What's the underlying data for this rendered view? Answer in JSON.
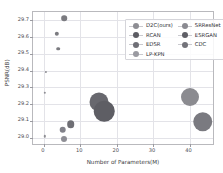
{
  "chart_data": {
    "type": "scatter",
    "title": "",
    "xlabel": "Number of Parameters(M)",
    "ylabel": "PSNR(dB)",
    "xlim": [
      -3,
      47
    ],
    "ylim": [
      28.95,
      29.75
    ],
    "xticks": [
      "0",
      "10",
      "20",
      "30",
      "40"
    ],
    "xtick_values": [
      0,
      10,
      20,
      30,
      40
    ],
    "yticks": [
      "29.0",
      "29.1",
      "29.2",
      "29.3",
      "29.4",
      "29.5",
      "29.6",
      "29.7"
    ],
    "ytick_values": [
      29.0,
      29.1,
      29.2,
      29.3,
      29.4,
      29.5,
      29.6,
      29.7
    ],
    "grid": true,
    "legend_position": "upper right",
    "size_encodes": "Number of Parameters(M)",
    "points": [
      {
        "label": "D2C(ours)",
        "x": 5.5,
        "y": 29.712,
        "size": 5.6,
        "color": "#7b7b80"
      },
      {
        "label": "D2C(ours)",
        "x": 3.6,
        "y": 29.62,
        "size": 4.4,
        "color": "#7b7b80"
      },
      {
        "label": "D2C(ours)",
        "x": 4.0,
        "y": 29.532,
        "size": 3.6,
        "color": "#7b7b80"
      },
      {
        "label": "D2C(ours)",
        "x": 0.6,
        "y": 29.392,
        "size": 2.2,
        "color": "#8e8e93"
      },
      {
        "label": "D2C(ours)",
        "x": 0.3,
        "y": 29.268,
        "size": 2.4,
        "color": "#8e8e93"
      },
      {
        "label": "D2C(ours)",
        "x": 0.2,
        "y": 29.007,
        "size": 2.4,
        "color": "#8e8e93"
      },
      {
        "label": "RCAN",
        "x": 15.0,
        "y": 29.21,
        "size": 19.0,
        "color": "#68686e"
      },
      {
        "label": "EDSR",
        "x": 16.6,
        "y": 29.156,
        "size": 20.5,
        "color": "#5e5e64"
      },
      {
        "label": "SRResNet",
        "x": 40.0,
        "y": 29.245,
        "size": 18.0,
        "color": "#8b8b90"
      },
      {
        "label": "ESRGAN",
        "x": 43.6,
        "y": 29.096,
        "size": 19.5,
        "color": "#7a7a80"
      },
      {
        "label": "CDC",
        "x": 7.4,
        "y": 29.08,
        "size": 7.6,
        "color": "#6e6e74"
      },
      {
        "label": "LP-KPN",
        "x": 5.2,
        "y": 29.048,
        "size": 6.6,
        "color": "#82828a"
      },
      {
        "label": "LP-KPN",
        "x": 5.6,
        "y": 28.99,
        "size": 6.0,
        "color": "#8e8e95"
      }
    ],
    "legend": {
      "columns": [
        [
          {
            "label": "D2C(ours)",
            "color": "#8d8d93"
          },
          {
            "label": "RCAN",
            "color": "#5c5c63"
          },
          {
            "label": "EDSR",
            "color": "#6f6f76"
          },
          {
            "label": "LP-KPN",
            "color": "#9a9aa1"
          }
        ],
        [
          {
            "label": "SRResNet",
            "color": "#8a8a91"
          },
          {
            "label": "ESRGAN",
            "color": "#5f5f66"
          },
          {
            "label": "CDC",
            "color": "#73737a"
          }
        ]
      ]
    }
  }
}
